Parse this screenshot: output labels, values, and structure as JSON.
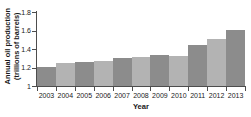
{
  "chart_data": {
    "type": "bar",
    "title": "",
    "xlabel": "Year",
    "ylabel": "Annual oil production (trillions of barrels)",
    "ylabel_line1": "Annual oil production",
    "ylabel_line2": "(trillions of barrels)",
    "categories": [
      "2003",
      "2004",
      "2005",
      "2006",
      "2007",
      "2008",
      "2009",
      "2010",
      "2011",
      "2012",
      "2013"
    ],
    "values": [
      1.205,
      1.245,
      1.26,
      1.275,
      1.3,
      1.31,
      1.33,
      1.325,
      1.445,
      1.51,
      1.61
    ],
    "ylim": [
      1,
      1.8
    ],
    "yticks": [
      "1",
      "1.2",
      "1.4",
      "1.6",
      "1.8"
    ],
    "ytick_values": [
      1,
      1.2,
      1.4,
      1.6,
      1.8
    ],
    "grid": false,
    "legend": "none",
    "bar_color_dark": "#8c8c8c",
    "bar_color_light": "#b3b3b3",
    "axis_color": "#4d4d4d",
    "text_color": "#1a1a1a",
    "background": "#ffffff"
  }
}
